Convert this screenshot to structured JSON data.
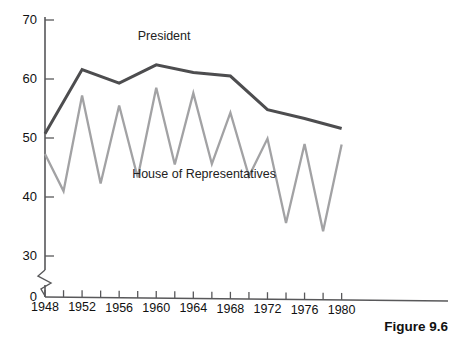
{
  "figure": {
    "caption": "Figure 9.6"
  },
  "chart_data": {
    "type": "line",
    "title": "",
    "subtitle": "",
    "xlabel": "",
    "ylabel": "",
    "xlim": [
      1948,
      1982
    ],
    "ylim": [
      30,
      70
    ],
    "y_axis_break": true,
    "y_axis_break_to": 0,
    "grid": false,
    "legend_position": "inline-annotation",
    "y_ticks": [
      70,
      60,
      50,
      40,
      30,
      0
    ],
    "y_tick_labels": [
      "70",
      "60",
      "50",
      "40",
      "30",
      "0"
    ],
    "x_ticks": [
      1948,
      1950,
      1952,
      1954,
      1956,
      1958,
      1960,
      1962,
      1964,
      1966,
      1968,
      1970,
      1972,
      1974,
      1976,
      1978,
      1980
    ],
    "x_tick_labels_shown": [
      "1948",
      "1952",
      "1956",
      "1960",
      "1964",
      "1968",
      "1972",
      "1976",
      "1980"
    ],
    "series": [
      {
        "name": "President",
        "color": "#4d4d4f",
        "width": 3.0,
        "label_text": "President",
        "label_x": 1958.0,
        "label_y": 66.6,
        "x": [
          1948,
          1952,
          1956,
          1960,
          1964,
          1968,
          1972,
          1976,
          1980
        ],
        "values": [
          50.7,
          61.6,
          59.3,
          62.4,
          61.1,
          60.5,
          54.8,
          53.3,
          51.6
        ]
      },
      {
        "name": "House of Representatives",
        "color": "#a2a2a4",
        "width": 2.3,
        "label_text": "House of Representatives",
        "label_x": 1957.4,
        "label_y": 43.2,
        "x": [
          1948,
          1950,
          1952,
          1954,
          1956,
          1958,
          1960,
          1962,
          1964,
          1966,
          1968,
          1970,
          1972,
          1974,
          1976,
          1978,
          1980
        ],
        "values": [
          47.3,
          41.0,
          57.2,
          42.3,
          55.5,
          43.3,
          58.5,
          45.5,
          57.6,
          45.6,
          54.3,
          43.5,
          49.9,
          35.6,
          49.0,
          34.2,
          48.9
        ]
      }
    ]
  }
}
